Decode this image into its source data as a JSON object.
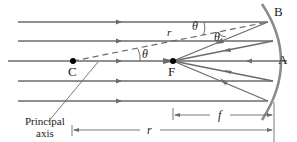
{
  "diagram": {
    "labels": {
      "center": "C",
      "focal_point": "F",
      "point_a": "A",
      "point_b": "B",
      "radius_ray": "r",
      "angle1": "θ",
      "angle2": "θ",
      "angle3": "θ",
      "principal_axis_line1": "Principal",
      "principal_axis_line2": "axis",
      "focal_length": "f",
      "radius_dim": "r"
    },
    "colors": {
      "ray": "#6b6b6b",
      "mirror": "#8a8a8a",
      "text": "#222222",
      "point": "#000000"
    }
  }
}
